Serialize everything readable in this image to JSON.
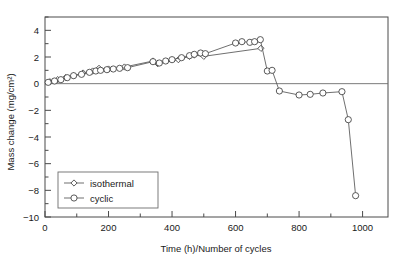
{
  "chart_data": {
    "type": "line",
    "title": "",
    "xlabel": "Time (h)/Number of cycles",
    "ylabel": "Mass change (mg/cm²)",
    "xlim": [
      0,
      1080
    ],
    "ylim": [
      -10,
      5
    ],
    "xticks": [
      0,
      200,
      400,
      600,
      800,
      1000
    ],
    "xtick_labels": [
      "0",
      "200",
      "400",
      "600",
      "800",
      "1000"
    ],
    "xminor_step": 100,
    "yticks": [
      4,
      2,
      0,
      -2,
      -4,
      -6,
      -8,
      -10
    ],
    "ytick_labels": [
      "4",
      "2",
      "0",
      "−2",
      "−4",
      "−6",
      "−8",
      "−10"
    ],
    "yminor_step": 1,
    "grid": false,
    "zero_reference_line": true,
    "legend_position": "lower-left",
    "series": [
      {
        "name": "isothermal",
        "marker": "diamond",
        "points": [
          [
            15,
            0.15
          ],
          [
            40,
            0.3
          ],
          [
            65,
            0.45
          ],
          [
            90,
            0.6
          ],
          [
            120,
            0.8
          ],
          [
            150,
            0.95
          ],
          [
            170,
            1.15
          ],
          [
            200,
            1.1
          ],
          [
            250,
            1.25
          ],
          [
            340,
            1.7
          ],
          [
            355,
            1.5
          ],
          [
            420,
            1.8
          ],
          [
            455,
            2.05
          ],
          [
            470,
            2.15
          ],
          [
            500,
            2.05
          ],
          [
            680,
            2.65
          ]
        ]
      },
      {
        "name": "cyclic",
        "marker": "circle",
        "points": [
          [
            10,
            0.1
          ],
          [
            30,
            0.2
          ],
          [
            50,
            0.3
          ],
          [
            70,
            0.45
          ],
          [
            90,
            0.6
          ],
          [
            115,
            0.7
          ],
          [
            140,
            0.85
          ],
          [
            160,
            0.95
          ],
          [
            175,
            1.0
          ],
          [
            195,
            1.05
          ],
          [
            215,
            1.1
          ],
          [
            235,
            1.15
          ],
          [
            260,
            1.2
          ],
          [
            340,
            1.65
          ],
          [
            360,
            1.55
          ],
          [
            380,
            1.7
          ],
          [
            400,
            1.8
          ],
          [
            430,
            1.95
          ],
          [
            455,
            2.1
          ],
          [
            470,
            2.2
          ],
          [
            490,
            2.3
          ],
          [
            505,
            2.25
          ],
          [
            600,
            3.05
          ],
          [
            620,
            3.15
          ],
          [
            645,
            3.1
          ],
          [
            660,
            3.15
          ],
          [
            678,
            3.3
          ],
          [
            700,
            0.95
          ],
          [
            715,
            1.0
          ],
          [
            738,
            -0.55
          ],
          [
            800,
            -0.85
          ],
          [
            835,
            -0.8
          ],
          [
            875,
            -0.7
          ],
          [
            935,
            -0.6
          ],
          [
            955,
            -2.7
          ],
          [
            978,
            -8.4
          ]
        ]
      }
    ]
  },
  "legend": {
    "items": [
      {
        "label": "isothermal",
        "marker": "diamond"
      },
      {
        "label": "cyclic",
        "marker": "circle"
      }
    ]
  }
}
